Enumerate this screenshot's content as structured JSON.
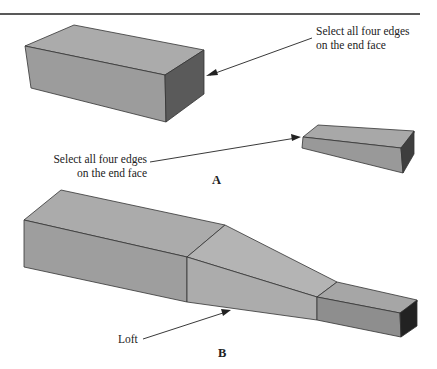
{
  "figure": {
    "part_a": {
      "label": "A",
      "callout_large_box": {
        "line1": "Select all four edges",
        "line2": "on the end face"
      },
      "callout_small_box": {
        "line1": "Select all four edges",
        "line2": "on the end face"
      }
    },
    "part_b": {
      "label": "B",
      "callout_loft": "Loft"
    },
    "colors": {
      "top_face": "#a9a9a9",
      "front_face": "#9a9a9a",
      "end_face": "#4a4a4a",
      "loft_face": "#b2b2b2",
      "edge": "#333333",
      "rule": "#222222"
    }
  }
}
